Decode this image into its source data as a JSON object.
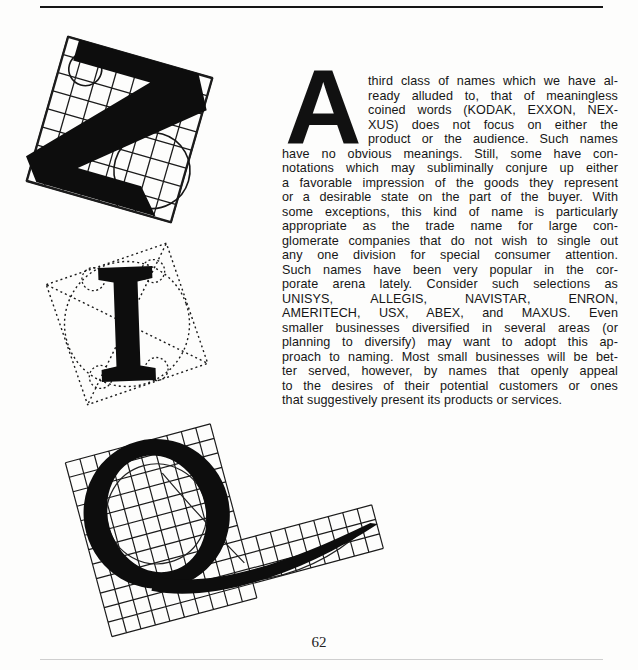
{
  "article": {
    "drop_cap": "A",
    "lines": [
      "third class of names which we have al-",
      "ready alluded to, that of meaningless",
      "coined words (KODAK, EXXON, NEX-",
      "XUS) does not focus on either the",
      "product or the audience. Such names",
      "have no obvious meanings. Still, some have con-",
      "notations which may subliminally conjure up either",
      "a favorable impression of the goods they represent",
      "or a desirable state on the part of the buyer. With",
      "some exceptions, this kind of name is particularly",
      "appropriate as the trade name for large con-",
      "glomerate companies that do not wish to single out",
      "any one division for special consumer attention.",
      "Such names have been very popular in the cor-",
      "porate arena lately. Consider such selections as",
      "UNISYS,  ALLEGIS,  NAVISTAR,  ENRON,",
      "AMERITECH, USX, ABEX, and MAXUS. Even",
      "smaller businesses diversified in several areas (or",
      "planning to diversify) may want to adopt this ap-",
      "proach to naming. Most small businesses will be bet-",
      "ter served, however, by names that openly appeal",
      "to the desires of their potential customers or ones",
      "that suggestively present its products or services."
    ]
  },
  "figures": {
    "letter_z": {
      "glyph": "Z",
      "style": "black letter on rotated square grid with construction circles"
    },
    "letter_i": {
      "glyph": "I",
      "style": "black serif letter in dotted construction square with inscribed circle and diagonals"
    },
    "letter_q": {
      "glyph": "Q",
      "style": "black letter with long tail on rotated grid with construction circle"
    }
  },
  "page": {
    "number": "62"
  },
  "colors": {
    "ink": "#141414",
    "paper": "#fdfdfc"
  }
}
